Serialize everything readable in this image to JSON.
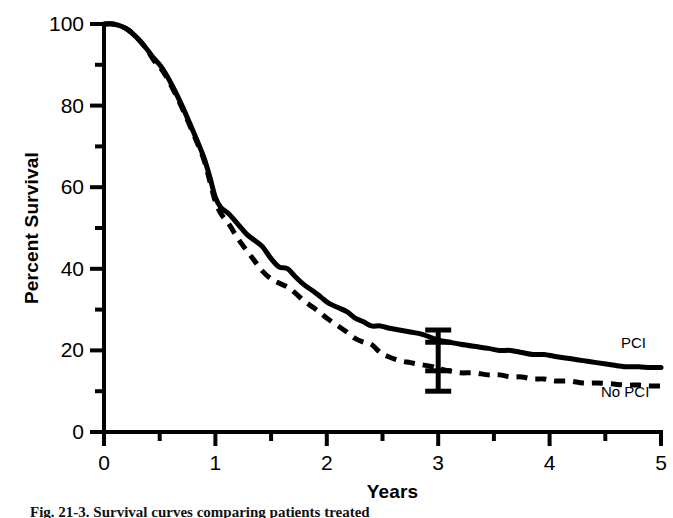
{
  "figure": {
    "background_color": "#ffffff",
    "ink_color": "#000000",
    "caption_partial": "Fig. 21-3.  Survival curves comparing patients treated"
  },
  "axes": {
    "y_title": "Percent Survival",
    "x_title": "Years",
    "y_major_ticks": [
      "0",
      "20",
      "40",
      "60",
      "80",
      "100"
    ],
    "y_minor_ticks": [
      "10",
      "30",
      "50",
      "70",
      "90"
    ],
    "x_major_ticks": [
      "0",
      "1",
      "2",
      "3",
      "4",
      "5"
    ],
    "x_minor_ticks": [
      "0.5",
      "1.5",
      "2.5",
      "3.5",
      "4.5"
    ]
  },
  "annotations": {
    "pci_label": "PCI",
    "no_pci_label": "No PCI",
    "errorbar_name": "error-bar-year-3"
  },
  "chart_data": {
    "type": "line",
    "title": "",
    "subtitle": "",
    "xlabel": "Years",
    "ylabel": "Percent Survival",
    "xlim": [
      0,
      5
    ],
    "ylim": [
      0,
      100
    ],
    "grid": false,
    "legend_position": "right-inline",
    "x_major_tick_step": 1,
    "x_minor_tick_step": 0.5,
    "y_major_tick_step": 20,
    "y_minor_tick_step": 10,
    "series": [
      {
        "name": "PCI",
        "style": "solid",
        "color": "#000000",
        "label_position": {
          "x": 5.02,
          "y": 20.5
        },
        "points": [
          [
            0.0,
            100
          ],
          [
            0.08,
            100
          ],
          [
            0.15,
            99.5
          ],
          [
            0.22,
            98.5
          ],
          [
            0.3,
            96.5
          ],
          [
            0.38,
            94.0
          ],
          [
            0.45,
            91.5
          ],
          [
            0.5,
            90.0
          ],
          [
            0.55,
            88.0
          ],
          [
            0.62,
            84.5
          ],
          [
            0.7,
            80.0
          ],
          [
            0.78,
            75.0
          ],
          [
            0.85,
            70.5
          ],
          [
            0.9,
            67.0
          ],
          [
            0.95,
            62.5
          ],
          [
            1.0,
            57.5
          ],
          [
            1.05,
            55.0
          ],
          [
            1.12,
            53.5
          ],
          [
            1.2,
            51.0
          ],
          [
            1.28,
            48.5
          ],
          [
            1.35,
            47.0
          ],
          [
            1.42,
            45.5
          ],
          [
            1.5,
            42.5
          ],
          [
            1.57,
            40.5
          ],
          [
            1.65,
            40.0
          ],
          [
            1.72,
            38.0
          ],
          [
            1.8,
            36.0
          ],
          [
            1.88,
            34.5
          ],
          [
            1.95,
            33.0
          ],
          [
            2.02,
            31.5
          ],
          [
            2.1,
            30.5
          ],
          [
            2.18,
            29.5
          ],
          [
            2.25,
            28.0
          ],
          [
            2.33,
            27.0
          ],
          [
            2.4,
            26.0
          ],
          [
            2.48,
            26.0
          ],
          [
            2.55,
            25.5
          ],
          [
            2.65,
            25.0
          ],
          [
            2.75,
            24.5
          ],
          [
            2.85,
            24.0
          ],
          [
            2.95,
            23.0
          ],
          [
            3.0,
            22.5
          ],
          [
            3.1,
            22.0
          ],
          [
            3.2,
            21.5
          ],
          [
            3.32,
            21.0
          ],
          [
            3.45,
            20.5
          ],
          [
            3.55,
            20.0
          ],
          [
            3.65,
            20.0
          ],
          [
            3.75,
            19.5
          ],
          [
            3.85,
            19.0
          ],
          [
            3.95,
            19.0
          ],
          [
            4.05,
            18.5
          ],
          [
            4.18,
            18.0
          ],
          [
            4.3,
            17.5
          ],
          [
            4.42,
            17.0
          ],
          [
            4.55,
            16.5
          ],
          [
            4.68,
            16.0
          ],
          [
            4.8,
            16.0
          ],
          [
            4.9,
            15.8
          ],
          [
            5.0,
            15.8
          ]
        ]
      },
      {
        "name": "No PCI",
        "style": "dashed",
        "color": "#000000",
        "label_position": {
          "x": 5.02,
          "y": 8.5
        },
        "points": [
          [
            0.0,
            100
          ],
          [
            0.08,
            100
          ],
          [
            0.15,
            99.5
          ],
          [
            0.22,
            98.5
          ],
          [
            0.3,
            96.5
          ],
          [
            0.38,
            94.0
          ],
          [
            0.45,
            91.0
          ],
          [
            0.5,
            89.5
          ],
          [
            0.55,
            87.5
          ],
          [
            0.62,
            84.0
          ],
          [
            0.7,
            79.5
          ],
          [
            0.78,
            74.5
          ],
          [
            0.85,
            70.0
          ],
          [
            0.9,
            66.5
          ],
          [
            0.95,
            61.5
          ],
          [
            1.0,
            56.5
          ],
          [
            1.05,
            53.5
          ],
          [
            1.12,
            51.0
          ],
          [
            1.2,
            47.5
          ],
          [
            1.28,
            44.5
          ],
          [
            1.35,
            42.0
          ],
          [
            1.42,
            39.5
          ],
          [
            1.5,
            37.5
          ],
          [
            1.57,
            36.5
          ],
          [
            1.65,
            35.5
          ],
          [
            1.72,
            34.0
          ],
          [
            1.8,
            32.0
          ],
          [
            1.88,
            30.5
          ],
          [
            1.95,
            29.0
          ],
          [
            2.02,
            27.5
          ],
          [
            2.1,
            26.0
          ],
          [
            2.18,
            24.5
          ],
          [
            2.25,
            23.0
          ],
          [
            2.33,
            22.0
          ],
          [
            2.4,
            21.5
          ],
          [
            2.48,
            19.5
          ],
          [
            2.55,
            18.5
          ],
          [
            2.65,
            17.5
          ],
          [
            2.75,
            17.0
          ],
          [
            2.85,
            16.5
          ],
          [
            2.95,
            16.0
          ],
          [
            3.0,
            15.5
          ],
          [
            3.1,
            15.0
          ],
          [
            3.2,
            14.5
          ],
          [
            3.32,
            14.5
          ],
          [
            3.45,
            14.0
          ],
          [
            3.55,
            14.0
          ],
          [
            3.65,
            13.5
          ],
          [
            3.75,
            13.5
          ],
          [
            3.85,
            13.0
          ],
          [
            3.95,
            13.0
          ],
          [
            4.05,
            12.5
          ],
          [
            4.18,
            12.5
          ],
          [
            4.3,
            12.0
          ],
          [
            4.42,
            12.0
          ],
          [
            4.55,
            11.8
          ],
          [
            4.68,
            11.5
          ],
          [
            4.8,
            11.5
          ],
          [
            4.9,
            11.3
          ],
          [
            5.0,
            11.3
          ]
        ]
      }
    ],
    "error_bars": [
      {
        "series": "PCI",
        "x": 3.0,
        "y": 22.0,
        "upper": 25.0,
        "lower": 10.0,
        "mid_marks": [
          22.0,
          15.0
        ]
      }
    ]
  }
}
